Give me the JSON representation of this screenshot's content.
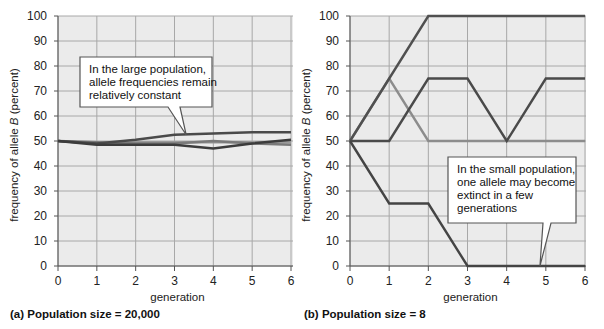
{
  "chart_data": [
    {
      "type": "line",
      "panel": "a",
      "caption": "(a) Population size = 20,000",
      "xlabel": "generation",
      "ylabel_prefix": "frequency of allele ",
      "ylabel_italic": "B",
      "ylabel_suffix": " (percent)",
      "x": [
        0,
        1,
        2,
        3,
        4,
        5,
        6
      ],
      "xlim": [
        0,
        6
      ],
      "ylim": [
        0,
        100
      ],
      "xticks": [
        "0",
        "1",
        "2",
        "3",
        "4",
        "5",
        "6"
      ],
      "yticks": [
        "0",
        "10",
        "20",
        "30",
        "40",
        "50",
        "60",
        "70",
        "80",
        "90",
        "100"
      ],
      "grid": true,
      "series": [
        {
          "name": "population 1",
          "color": "#4a4a4a",
          "values": [
            50,
            49,
            50.5,
            52.5,
            53,
            53.5,
            53.5
          ]
        },
        {
          "name": "population 2",
          "color": "#3c3c3c",
          "values": [
            50,
            48.5,
            48.5,
            48.5,
            47,
            49,
            50.5
          ]
        },
        {
          "name": "population 3",
          "color": "#7a7a7a",
          "values": [
            50,
            49.5,
            49,
            49,
            50,
            49,
            48.5
          ]
        },
        {
          "name": "population 4",
          "color": "#9a9a9a",
          "values": [
            50,
            49,
            49.5,
            49.5,
            49.5,
            49.5,
            49.5
          ]
        }
      ],
      "annotation": {
        "text_lines": [
          "In the large population,",
          "allele frequencies remain",
          "relatively constant"
        ],
        "points_to": {
          "x": 3.3,
          "y": 52.5
        }
      }
    },
    {
      "type": "line",
      "panel": "b",
      "caption": "(b) Population size = 8",
      "xlabel": "generation",
      "ylabel_prefix": "frequency of allele ",
      "ylabel_italic": "B",
      "ylabel_suffix": " (percent)",
      "x": [
        0,
        1,
        2,
        3,
        4,
        5,
        6
      ],
      "xlim": [
        0,
        6
      ],
      "ylim": [
        0,
        100
      ],
      "xticks": [
        "0",
        "1",
        "2",
        "3",
        "4",
        "5",
        "6"
      ],
      "yticks": [
        "0",
        "10",
        "20",
        "30",
        "40",
        "50",
        "60",
        "70",
        "80",
        "90",
        "100"
      ],
      "grid": true,
      "series": [
        {
          "name": "population 1",
          "color": "#505050",
          "values": [
            50,
            75,
            100,
            100,
            100,
            100,
            100
          ]
        },
        {
          "name": "population 2",
          "color": "#8c8c8c",
          "values": [
            50,
            75,
            50,
            50,
            50,
            50,
            50
          ]
        },
        {
          "name": "population 3",
          "color": "#4a4a4a",
          "values": [
            50,
            50,
            75,
            75,
            50,
            75,
            75
          ]
        },
        {
          "name": "population 4",
          "color": "#444444",
          "values": [
            50,
            25,
            25,
            0,
            0,
            0,
            0
          ]
        }
      ],
      "annotation": {
        "text_lines": [
          "In the small population,",
          "one allele may become",
          "extinct in a few",
          "generations"
        ],
        "points_to": {
          "x": 4.85,
          "y": 0
        }
      }
    }
  ],
  "colors": {
    "plot_background": "#ebebeb",
    "grid": "#a8a8a8",
    "axis": "#555555",
    "callout_border": "#555555",
    "callout_fill": "#ffffff"
  }
}
